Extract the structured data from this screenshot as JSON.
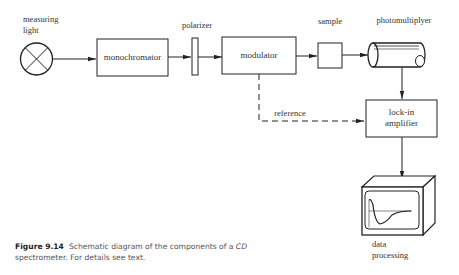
{
  "diagram": {
    "nodes": [
      {
        "id": "light",
        "label_line1": "measuring",
        "label_line2": "light",
        "icon": "lamp-cross-circle-icon"
      },
      {
        "id": "monochromator",
        "label": "monochromator"
      },
      {
        "id": "polarizer",
        "label": "polarizer"
      },
      {
        "id": "modulator",
        "label": "modulator"
      },
      {
        "id": "sample",
        "label": "sample"
      },
      {
        "id": "photomultiplyer",
        "label": "photomultiplyer",
        "icon": "cylinder-tube-icon"
      },
      {
        "id": "lockin",
        "label_line1": "lock-in",
        "label_line2": "amplifier"
      },
      {
        "id": "dataproc",
        "label_line1": "data",
        "label_line2": "processing",
        "icon": "monitor-icon"
      }
    ],
    "edges": [
      {
        "from": "light",
        "to": "monochromator",
        "style": "solid"
      },
      {
        "from": "monochromator",
        "to": "polarizer",
        "style": "solid"
      },
      {
        "from": "polarizer",
        "to": "modulator",
        "style": "solid"
      },
      {
        "from": "modulator",
        "to": "sample",
        "style": "solid"
      },
      {
        "from": "sample",
        "to": "photomultiplyer",
        "style": "solid"
      },
      {
        "from": "photomultiplyer",
        "to": "lockin",
        "style": "solid"
      },
      {
        "from": "modulator",
        "to": "lockin",
        "style": "dashed",
        "label": "reference"
      },
      {
        "from": "lockin",
        "to": "dataproc",
        "style": "solid"
      }
    ],
    "reference_label": "reference"
  },
  "caption": {
    "figure_label": "Figure 9.14",
    "text_part1": "Schematic diagram of the components of a ",
    "text_italic": "CD",
    "text_part2": " spectrometer. For details see text."
  }
}
